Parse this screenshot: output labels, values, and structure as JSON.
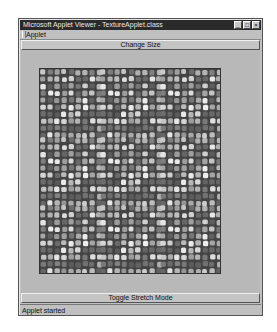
{
  "window": {
    "title": "Microsoft Applet Viewer - TextureApplet.class",
    "controls": {
      "minimize": "_",
      "maximize": "□",
      "close": "×"
    }
  },
  "menubar": {
    "items": [
      {
        "label": "Applet"
      }
    ]
  },
  "buttons": {
    "change_size": "Change Size",
    "toggle_stretch": "Toggle Stretch Mode"
  },
  "canvas": {
    "content": "tiled grayscale cobblestone/voronoi texture",
    "tiles": {
      "cols": 3,
      "rows": 3
    }
  },
  "status": {
    "text": "Applet started"
  },
  "colors": {
    "window_bg": "#c0c0c0",
    "titlebar_bg": "#2a2a2a",
    "texture_border": "#333333"
  }
}
